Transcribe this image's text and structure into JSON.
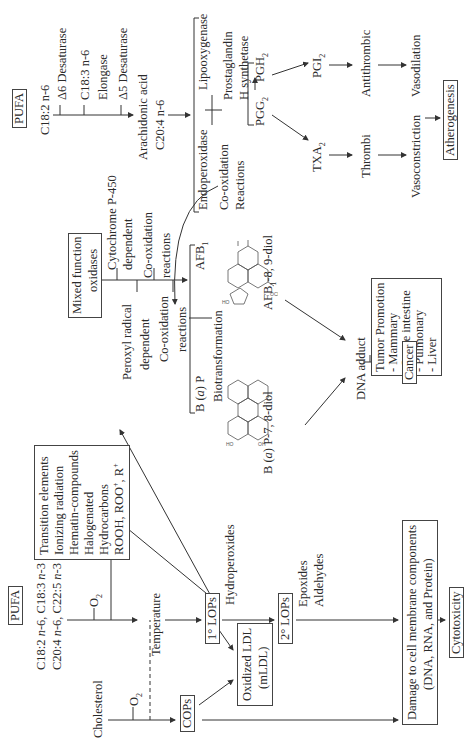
{
  "diagram": {
    "orientation": "rotated 90 degrees counter-clockwise",
    "top_pathway": {
      "pufa_label": "PUFA",
      "c18_2": "C18:2 n-6",
      "d6_desaturase": "Δ6 Desaturase",
      "c18_3": "C18:3 n-6",
      "elongase": "Elongase",
      "d5_desaturase": "Δ5 Desaturase",
      "arachidonic_acid": "Arachidonic acid",
      "c20_4": "C20:4 n-6",
      "lipooxygenase": "Lipooxygenase",
      "endoperoxidase": "Endoperoxidase",
      "prostaglandin_h_synthetase_line1": "Prostaglandin",
      "prostaglandin_h_synthetase_line2": "H synthetase",
      "cooxidation_line1": "Co-oxidation",
      "cooxidation_line2": "Reactions",
      "pgg2": "PGG2",
      "pgh2": "PGH2",
      "pgi2": "PGI2",
      "txa2": "TXA2",
      "antithrombic": "Antithrombic",
      "vasodilation": "Vasodilation",
      "thrombi": "Thrombi",
      "vasoconstriction": "Vasoconstriction",
      "atherogenesis": "Atherogenesis"
    },
    "middle_pathway": {
      "mixed_function_line1": "Mixed function",
      "mixed_function_line2": "oxidases",
      "cyp450_line1": "Cytochrome P-450",
      "cyp450_line2": "dependent",
      "coox_reactions_a_line1": "Co-oxidation",
      "coox_reactions_a_line2": "reactions",
      "peroxyl_line1": "Peroxyl radical",
      "peroxyl_line2": "dependent",
      "coox_reactions_b_line1": "Co-oxidation",
      "coox_reactions_b_line2": "reactions",
      "afb1": "AFB1",
      "bap": "B (a) P",
      "biotransformation": "Biotransformation",
      "afb1_diol": "AFB1-8, 9-diol",
      "bap_diol": "B (a) P-7, 8-diol",
      "dna_adduct": "DNA adduct",
      "tumor_promotion": [
        "Tumor Promotion",
        "- Mammary",
        "- Large intestine",
        "- Pulmonary",
        "- Liver"
      ],
      "cancer": "Cancer"
    },
    "bottom_pathway": {
      "pufa_label": "PUFA",
      "pufa_line1": "C18:2 n-6, C18:3 n-3",
      "pufa_line2": "C20:4 n-6, C22:5 n-3",
      "o2_a": "O2",
      "catalysts": [
        "Transition elements",
        "Ionizing radiation",
        "Hematin-compounds",
        "Halogenated",
        "Hydrocarbons",
        "ROOH, ROO+, R+"
      ],
      "cholesterol": "Cholesterol",
      "o2_b": "O2",
      "temperature": "Temperature",
      "primary_lops": "1° LOPs",
      "hydroperoxides": "Hydroperoxides",
      "cops": "COPs",
      "oxidized_ldl_line1": "Oxidized LDL",
      "oxidized_ldl_line2": "(mLDL)",
      "secondary_lops": "2° LOPs",
      "epoxides": "Epoxides",
      "aldehydes": "Aldehydes",
      "damage_line1": "Damage to cell membrane components",
      "damage_line2": "(DNA, RNA, and Protein)",
      "cytotoxicity": "Cytotoxicity"
    },
    "colors": {
      "line": "#333333",
      "text": "#2a2a2a",
      "background": "#ffffff"
    }
  }
}
